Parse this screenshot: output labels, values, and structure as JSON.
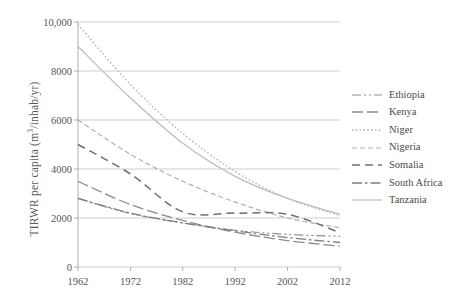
{
  "chart_data": {
    "type": "line",
    "title": "",
    "xlabel": "",
    "ylabel": "TIRWR per capita (m3/inhab/yr)",
    "ylabel_parts": {
      "pre": "TIRWR per capita (m",
      "sup": "3",
      "post": "/inhab/yr)"
    },
    "x": [
      1962,
      1972,
      1982,
      1992,
      2002,
      2012
    ],
    "xlim": [
      1962,
      2012
    ],
    "ylim": [
      0,
      10000
    ],
    "yticks": [
      0,
      2000,
      4000,
      6000,
      8000,
      10000
    ],
    "ytick_labels": [
      "0",
      "2000",
      "4000",
      "6000",
      "8000",
      "10,000"
    ],
    "xtick_labels": [
      "1962",
      "1972",
      "1982",
      "1992",
      "2002",
      "2012"
    ],
    "grid": true,
    "legend_position": "right",
    "series": [
      {
        "name": "Ethiopia",
        "dash": "dash-dot-dot",
        "color": "#8d8d8d",
        "width": 1.2,
        "dasharray": "9,3,2,3,2,3",
        "values": [
          2800,
          2180,
          1800,
          1500,
          1330,
          1250
        ]
      },
      {
        "name": "Kenya",
        "dash": "long-dash",
        "color": "#8a8a8a",
        "width": 1.3,
        "dasharray": "11,4",
        "values": [
          3500,
          2550,
          1900,
          1420,
          1080,
          850
        ]
      },
      {
        "name": "Niger",
        "dash": "dotted",
        "color": "#b2b2b2",
        "width": 1.3,
        "dasharray": "1.6,2.2",
        "values": [
          9900,
          7450,
          5450,
          3900,
          2800,
          2100
        ]
      },
      {
        "name": "Nigeria",
        "dash": "short-dash",
        "color": "#b0b0b0",
        "width": 1.2,
        "dasharray": "5,3",
        "values": [
          6000,
          4600,
          3500,
          2650,
          2000,
          1600
        ]
      },
      {
        "name": "Somalia",
        "dash": "medium-dash",
        "color": "#6f6f6f",
        "width": 1.5,
        "dasharray": "8,5",
        "values": [
          5000,
          3800,
          2250,
          2200,
          2150,
          1400
        ]
      },
      {
        "name": "South Africa",
        "dash": "dash-dot",
        "color": "#7e7e7e",
        "width": 1.3,
        "dasharray": "10,3,2.5,3",
        "values": [
          2800,
          2200,
          1800,
          1480,
          1200,
          1000
        ]
      },
      {
        "name": "Tanzania",
        "dash": "solid",
        "color": "#bdbdbd",
        "width": 1.3,
        "dasharray": "none",
        "values": [
          9000,
          6900,
          5050,
          3700,
          2800,
          2150
        ]
      }
    ]
  },
  "axes": {
    "grid_color": "#b9b9b9",
    "axis_color": "#9a9a9a",
    "tick_text_color": "#555555"
  }
}
